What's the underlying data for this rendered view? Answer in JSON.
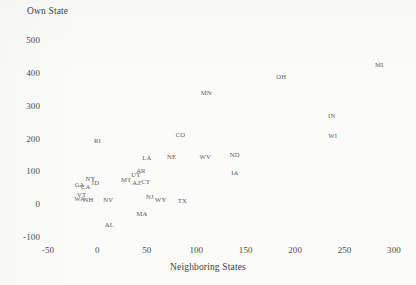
{
  "chart_data": {
    "type": "scatter",
    "title": "",
    "xlabel": "Neighboring States",
    "ylabel": "Own State",
    "xlim": [
      -50,
      300
    ],
    "ylim": [
      -100,
      500
    ],
    "xticks": [
      "-50",
      "0",
      "50",
      "100",
      "150",
      "200",
      "250",
      "300"
    ],
    "yticks": [
      "500",
      "400",
      "300",
      "200",
      "100",
      "0",
      "-100"
    ],
    "grid": false,
    "legend": null,
    "marker_style": "text-label",
    "points": [
      {
        "label": "MI",
        "x": 285,
        "y": 425
      },
      {
        "label": "OH",
        "x": 186,
        "y": 387
      },
      {
        "label": "MN",
        "x": 110,
        "y": 338
      },
      {
        "label": "IN",
        "x": 237,
        "y": 268
      },
      {
        "label": "CO",
        "x": 84,
        "y": 212
      },
      {
        "label": "WI",
        "x": 238,
        "y": 207
      },
      {
        "label": "RI",
        "x": 0,
        "y": 193
      },
      {
        "label": "ND",
        "x": 139,
        "y": 151
      },
      {
        "label": "WV",
        "x": 109,
        "y": 143
      },
      {
        "label": "NE",
        "x": 75,
        "y": 143
      },
      {
        "label": "LA",
        "x": 50,
        "y": 140
      },
      {
        "label": "IA",
        "x": 139,
        "y": 96
      },
      {
        "label": "AR",
        "x": 44,
        "y": 102
      },
      {
        "label": "UT",
        "x": 39,
        "y": 88
      },
      {
        "label": "NY",
        "x": -7,
        "y": 77
      },
      {
        "label": "MT",
        "x": 29,
        "y": 74
      },
      {
        "label": "CT",
        "x": 49,
        "y": 66
      },
      {
        "label": "ID",
        "x": -2,
        "y": 64
      },
      {
        "label": "AZ",
        "x": 40,
        "y": 63
      },
      {
        "label": "GA",
        "x": -18,
        "y": 57
      },
      {
        "label": "CA",
        "x": -12,
        "y": 51
      },
      {
        "label": "VT",
        "x": -16,
        "y": 29
      },
      {
        "label": "NJ",
        "x": 53,
        "y": 23
      },
      {
        "label": "WA",
        "x": -18,
        "y": 15
      },
      {
        "label": "NH",
        "x": -9,
        "y": 14
      },
      {
        "label": "NV",
        "x": 11,
        "y": 13
      },
      {
        "label": "WY",
        "x": 64,
        "y": 12
      },
      {
        "label": "TX",
        "x": 86,
        "y": 11
      },
      {
        "label": "MA",
        "x": 45,
        "y": -31
      },
      {
        "label": "AL",
        "x": 12,
        "y": -62
      }
    ]
  },
  "axes": {
    "y_title": "Own State",
    "x_title": "Neighboring States"
  }
}
